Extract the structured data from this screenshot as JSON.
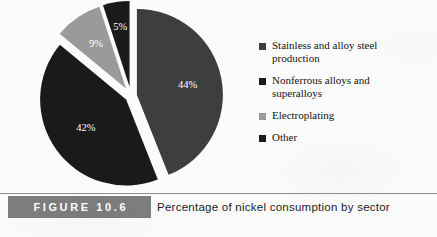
{
  "figure": {
    "number_label": "FIGURE 10.6",
    "caption": "Percentage of nickel consumption by sector"
  },
  "legend": {
    "items": [
      {
        "label": "Stainless and alloy steel\nproduction",
        "color": "#3e3e3e",
        "swatch_icon": "legend-square-icon"
      },
      {
        "label": "Nonferrous alloys and\nsuperalloys",
        "color": "#1a1a1a",
        "swatch_icon": "legend-square-icon"
      },
      {
        "label": "Electroplating",
        "color": "#9a9a9a",
        "swatch_icon": "legend-square-icon"
      },
      {
        "label": "Other",
        "color": "#1a1a1a",
        "swatch_icon": "legend-square-icon"
      }
    ]
  },
  "chart_data": {
    "type": "pie",
    "title": "Percentage of nickel consumption by sector",
    "exploded": true,
    "labels": [
      "Stainless and alloy steel production",
      "Nonferrous alloys and superalloys",
      "Electroplating",
      "Other"
    ],
    "values": [
      44,
      42,
      9,
      5
    ],
    "value_labels": [
      "44%",
      "42%",
      "9%",
      "5%"
    ],
    "colors": [
      "#3e3e3e",
      "#1a1a1a",
      "#9a9a9a",
      "#1a1a1a"
    ],
    "label_text_color": "#ffffff",
    "units": "percent",
    "total": 100,
    "legend_position": "right",
    "grid": false
  }
}
